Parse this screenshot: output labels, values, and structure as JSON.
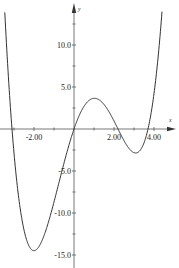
{
  "chart_data": {
    "type": "line",
    "title": "",
    "xlabel": "x",
    "ylabel": "y",
    "xlim": [
      -3.7,
      4.9
    ],
    "ylim": [
      -16.0,
      15.0
    ],
    "grid": false,
    "legend": null,
    "x_ticks": [
      -2.0,
      2.0,
      4.0
    ],
    "x_tick_labels": [
      "-2.00",
      "2.00",
      "4.00"
    ],
    "x_minor_ticks": [
      -3.0,
      -1.0,
      1.0,
      3.0
    ],
    "y_ticks": [
      10.0,
      5.0,
      -5.0,
      -10.0,
      -15.0
    ],
    "y_tick_labels": [
      "10.0",
      "5.0",
      "-5.0",
      "-10.0",
      "-15.0"
    ],
    "y_minor_ticks": [
      12.5,
      7.5,
      2.5,
      -2.5,
      -7.5,
      -12.5
    ],
    "series": [
      {
        "name": "f(x)",
        "description": "quartic curve with roots near -3.1, 0, 2.2, 3.7",
        "x": [
          -3.45,
          -3.1,
          -3.0,
          -2.5,
          -2.0,
          -1.5,
          -1.0,
          -0.5,
          0.0,
          0.5,
          1.0,
          1.5,
          2.0,
          2.2,
          2.5,
          3.0,
          3.5,
          3.7,
          4.0,
          4.45
        ],
        "y": [
          14.0,
          0.0,
          -3.4,
          -11.3,
          -14.5,
          -14.1,
          -10.7,
          -5.7,
          0.0,
          2.6,
          3.65,
          2.9,
          0.9,
          0.0,
          -1.5,
          -2.8,
          -1.4,
          0.0,
          3.2,
          14.5
        ]
      }
    ],
    "annotations": {
      "local_max": [
        1.0,
        3.65
      ],
      "global_min": [
        -2.0,
        -14.8
      ],
      "local_min": [
        2.95,
        -2.7
      ]
    }
  },
  "axes": {
    "x_name": "x",
    "y_name": "y"
  }
}
